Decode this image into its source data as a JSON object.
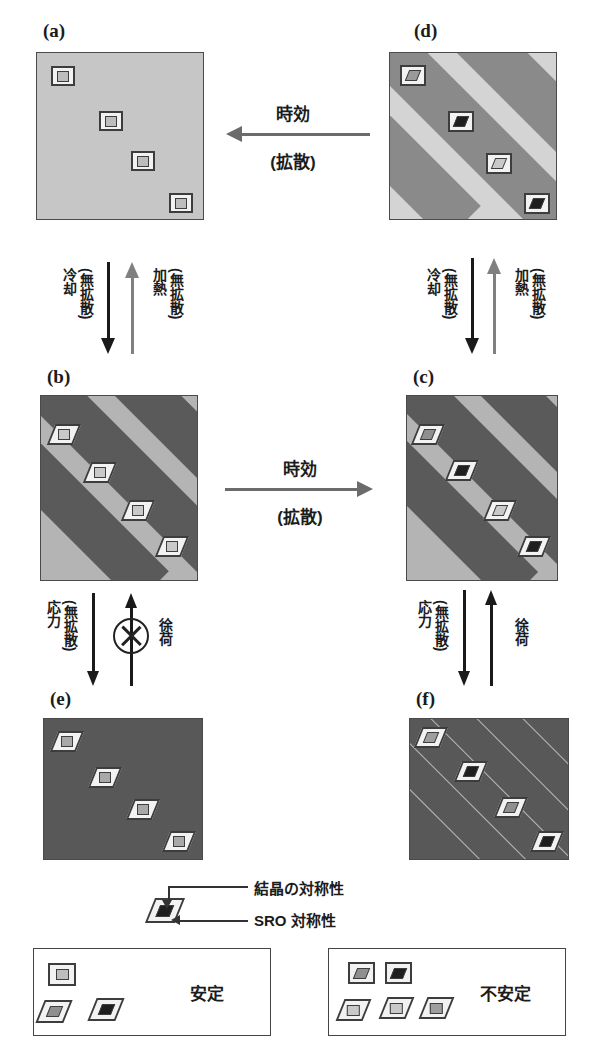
{
  "figure": {
    "panels": [
      {
        "id": "a",
        "label": "(a)",
        "x": 36,
        "y": 52,
        "w": 168,
        "h": 168,
        "base": "#c6c6c6",
        "banded": false,
        "markers": [
          {
            "type": "square-in-square",
            "outer": "#f2f2f2",
            "inner": "#bdbdbd",
            "x": 14,
            "y": 13,
            "size": 24
          },
          {
            "type": "square-in-square",
            "outer": "#f2f2f2",
            "inner": "#bdbdbd",
            "x": 62,
            "y": 58,
            "size": 24
          },
          {
            "type": "square-in-square",
            "outer": "#f2f2f2",
            "inner": "#bdbdbd",
            "x": 94,
            "y": 98,
            "size": 24
          },
          {
            "type": "square-in-square",
            "outer": "#f2f2f2",
            "inner": "#bdbdbd",
            "x": 132,
            "y": 140,
            "size": 24
          }
        ]
      },
      {
        "id": "d",
        "label": "(d)",
        "x": 389,
        "y": 52,
        "w": 168,
        "h": 168,
        "base": "#d4d4d4",
        "band": "#8a8a8a",
        "banded": true,
        "markers": [
          {
            "type": "parallelogram-in-square",
            "outer": "#f2f2f2",
            "inner": "#9a9a9a",
            "x": 10,
            "y": 12,
            "size": 26
          },
          {
            "type": "parallelogram-in-square",
            "outer": "#f2f2f2",
            "inner": "#1e1e1e",
            "x": 58,
            "y": 58,
            "size": 26
          },
          {
            "type": "parallelogram-in-square",
            "outer": "#f2f2f2",
            "inner": "#c9c9c9",
            "x": 96,
            "y": 100,
            "size": 26
          },
          {
            "type": "parallelogram-in-square",
            "outer": "#f2f2f2",
            "inner": "#1e1e1e",
            "x": 134,
            "y": 140,
            "size": 26
          }
        ]
      },
      {
        "id": "b",
        "label": "(b)",
        "x": 40,
        "y": 395,
        "w": 158,
        "h": 186,
        "base": "#b4b4b4",
        "band": "#5a5a5a",
        "banded": true,
        "markers": [
          {
            "type": "square-in-parallelogram",
            "outer": "#f2f2f2",
            "inner": "#c9c9c9",
            "x": 10,
            "y": 28,
            "size": 26
          },
          {
            "type": "square-in-parallelogram",
            "outer": "#f2f2f2",
            "inner": "#c9c9c9",
            "x": 46,
            "y": 66,
            "size": 26
          },
          {
            "type": "square-in-parallelogram",
            "outer": "#f2f2f2",
            "inner": "#c9c9c9",
            "x": 84,
            "y": 104,
            "size": 26
          },
          {
            "type": "square-in-parallelogram",
            "outer": "#f2f2f2",
            "inner": "#c9c9c9",
            "x": 118,
            "y": 140,
            "size": 26
          }
        ]
      },
      {
        "id": "c",
        "label": "(c)",
        "x": 406,
        "y": 395,
        "w": 152,
        "h": 186,
        "base": "#b4b4b4",
        "band": "#5a5a5a",
        "banded": true,
        "markers": [
          {
            "type": "parallelogram-in-parallelogram",
            "outer": "#f2f2f2",
            "inner": "#8f8f8f",
            "x": 8,
            "y": 28,
            "size": 26
          },
          {
            "type": "parallelogram-in-parallelogram",
            "outer": "#f2f2f2",
            "inner": "#1e1e1e",
            "x": 42,
            "y": 64,
            "size": 26
          },
          {
            "type": "parallelogram-in-parallelogram",
            "outer": "#f2f2f2",
            "inner": "#c9c9c9",
            "x": 80,
            "y": 104,
            "size": 26
          },
          {
            "type": "parallelogram-in-parallelogram",
            "outer": "#f2f2f2",
            "inner": "#1e1e1e",
            "x": 114,
            "y": 140,
            "size": 26
          }
        ]
      },
      {
        "id": "e",
        "label": "(e)",
        "x": 43,
        "y": 718,
        "w": 160,
        "h": 142,
        "base": "#585858",
        "banded": false,
        "markers": [
          {
            "type": "square-in-parallelogram",
            "outer": "#f2f2f2",
            "inner": "#a8a8a8",
            "x": 10,
            "y": 12,
            "size": 26
          },
          {
            "type": "square-in-parallelogram",
            "outer": "#f2f2f2",
            "inner": "#a8a8a8",
            "x": 48,
            "y": 48,
            "size": 26
          },
          {
            "type": "square-in-parallelogram",
            "outer": "#f2f2f2",
            "inner": "#a8a8a8",
            "x": 86,
            "y": 80,
            "size": 26
          },
          {
            "type": "square-in-parallelogram",
            "outer": "#f2f2f2",
            "inner": "#a8a8a8",
            "x": 122,
            "y": 112,
            "size": 26
          }
        ]
      },
      {
        "id": "f",
        "label": "(f)",
        "x": 409,
        "y": 718,
        "w": 160,
        "h": 142,
        "base": "#585858",
        "banded": false,
        "hairlines": true,
        "markers": [
          {
            "type": "parallelogram-in-parallelogram",
            "outer": "#f2f2f2",
            "inner": "#9e9e9e",
            "x": 8,
            "y": 8,
            "size": 26
          },
          {
            "type": "parallelogram-in-parallelogram",
            "outer": "#f2f2f2",
            "inner": "#1e1e1e",
            "x": 48,
            "y": 42,
            "size": 26
          },
          {
            "type": "parallelogram-in-parallelogram",
            "outer": "#f2f2f2",
            "inner": "#8f8f8f",
            "x": 88,
            "y": 78,
            "size": 26
          },
          {
            "type": "parallelogram-in-parallelogram",
            "outer": "#f2f2f2",
            "inner": "#1e1e1e",
            "x": 124,
            "y": 112,
            "size": 26
          }
        ]
      }
    ],
    "horizontal_arrows": [
      {
        "id": "aging-top",
        "direction": "left",
        "top_label": "時効",
        "bottom_label": "(拡散)",
        "color": "#6b6b6b"
      },
      {
        "id": "aging-mid",
        "direction": "right",
        "top_label": "時効",
        "bottom_label": "(拡散)",
        "color": "#6b6b6b"
      }
    ],
    "vertical_transitions": [
      {
        "id": "a-to-b",
        "down_label_1": "冷却",
        "down_label_2": "(無拡散)",
        "up_label_1": "加熱",
        "up_label_2": "(無拡散)",
        "down_color": "#1a1a1a",
        "up_color": "#808080",
        "blocked": false
      },
      {
        "id": "d-to-c",
        "down_label_1": "冷却",
        "down_label_2": "(無拡散)",
        "up_label_1": "加熱",
        "up_label_2": "(無拡散)",
        "down_color": "#1a1a1a",
        "up_color": "#808080",
        "blocked": false
      },
      {
        "id": "b-to-e",
        "down_label_1": "応力",
        "down_label_2": "(無拡散)",
        "up_label_1": "徐荷",
        "up_label_2": "",
        "down_color": "#1a1a1a",
        "up_color": "#1a1a1a",
        "blocked": true
      },
      {
        "id": "c-to-f",
        "down_label_1": "応力",
        "down_label_2": "(無拡散)",
        "up_label_1": "徐荷",
        "up_label_2": "",
        "down_color": "#1a1a1a",
        "up_color": "#1a1a1a",
        "blocked": false
      }
    ],
    "key": {
      "crystal_symmetry_label": "結晶の対称性",
      "sro_symmetry_label": "SRO 対称性"
    },
    "legend": {
      "stable": {
        "label": "安定",
        "shapes": [
          {
            "type": "square-in-square",
            "inner": "#bdbdbd"
          },
          {
            "type": "parallelogram-in-parallelogram",
            "inner": "#8f8f8f"
          },
          {
            "type": "parallelogram-in-parallelogram",
            "inner": "#1e1e1e"
          }
        ]
      },
      "unstable": {
        "label": "不安定",
        "shapes": [
          {
            "type": "parallelogram-in-square",
            "inner": "#8f8f8f"
          },
          {
            "type": "parallelogram-in-square",
            "inner": "#1e1e1e"
          },
          {
            "type": "square-in-parallelogram",
            "inner": "#c9c9c9"
          },
          {
            "type": "square-in-parallelogram",
            "inner": "#c9c9c9"
          },
          {
            "type": "square-in-parallelogram",
            "inner": "#9e9e9e"
          }
        ]
      }
    }
  }
}
